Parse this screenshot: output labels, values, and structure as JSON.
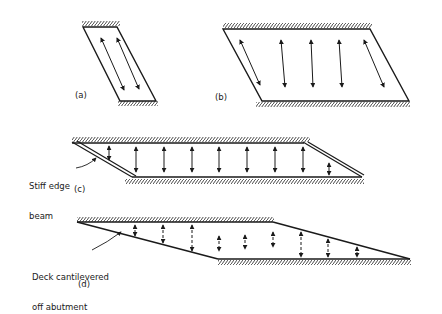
{
  "figure": {
    "panels": [
      {
        "id": "a",
        "label": "(a)",
        "description": "narrow skew slab, supported top and bottom, spanning diagonally"
      },
      {
        "id": "b",
        "label": "(b)",
        "description": "wide skew slab, square spanning in middle, skew spanning at edges"
      },
      {
        "id": "c",
        "label": "(c)",
        "description": "skew slab with stiff edge beams",
        "annotation": [
          "Stiff edge",
          "beam"
        ]
      },
      {
        "id": "d",
        "label": "(d)",
        "description": "deck cantilevered off abutment",
        "annotation": [
          "Deck cantilevered",
          "off abutment"
        ]
      }
    ]
  },
  "colors": {
    "ink": "#1a1a1a",
    "background": "#ffffff"
  }
}
